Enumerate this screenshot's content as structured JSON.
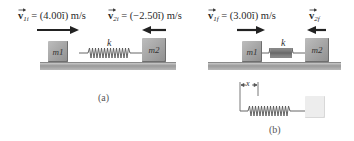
{
  "panel_a": {
    "caption": "(a)",
    "v1_label": {
      "symbol": "v",
      "subscript": "1i",
      "rest": " = (4.00î) m/s"
    },
    "v2_label": {
      "symbol": "v",
      "subscript": "2i",
      "rest": " = (−2.50î) m/s"
    },
    "block1": "m1",
    "block2": "m2",
    "spring_label": "k",
    "arrows": [
      {
        "name": "v1i",
        "direction": "right"
      },
      {
        "name": "v2i",
        "direction": "left"
      }
    ]
  },
  "panel_b": {
    "caption": "(b)",
    "v1_label": {
      "symbol": "v",
      "subscript": "1f",
      "rest": " = (3.00î) m/s"
    },
    "v2_label": {
      "symbol": "v",
      "subscript": "2f",
      "rest": ""
    },
    "block1": "m1",
    "block2": "m2",
    "spring_label": "k",
    "compression_label": "x",
    "arrows": [
      {
        "name": "v1f",
        "direction": "right"
      },
      {
        "name": "v2f",
        "direction": "left"
      }
    ]
  },
  "colors": {
    "block": "#a6a6a6",
    "floor": "#a9a9a9",
    "arrow": "#222222",
    "ghost_block": "#ededed"
  }
}
